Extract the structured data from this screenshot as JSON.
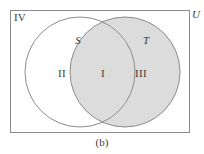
{
  "figure": {
    "caption": "(b)",
    "universe_label": "U",
    "complement_region_label": "IV",
    "background_color": "#ffffff",
    "stroke_color": "#8c8c8c",
    "shade_color": "#dcdcdc",
    "text_color": "#3a3a3a"
  },
  "sets": [
    {
      "name": "set-s",
      "label": "S",
      "cx": 80,
      "cy": 72,
      "r": 55,
      "fill": "#ffffff",
      "label_x": 78,
      "label_y": 40
    },
    {
      "name": "set-t",
      "label": "T",
      "cx": 125,
      "cy": 72,
      "r": 55,
      "fill": "#dcdcdc",
      "label_x": 146,
      "label_y": 40
    }
  ],
  "regions": [
    {
      "name": "region-s-only",
      "label": "II",
      "x": 62,
      "y": 73,
      "shaded": false
    },
    {
      "name": "region-intersection",
      "label": "I",
      "x": 103,
      "y": 73,
      "shaded": true
    },
    {
      "name": "region-t-only",
      "label": "III",
      "x": 141,
      "y": 73,
      "shaded": true
    },
    {
      "name": "region-outside",
      "label": "IV",
      "x": 20,
      "y": 17,
      "shaded": false
    }
  ],
  "universe_rect": {
    "x": 10,
    "y": 10,
    "width": 180,
    "height": 123
  },
  "universe_label_pos": {
    "x": 196,
    "y": 14
  }
}
